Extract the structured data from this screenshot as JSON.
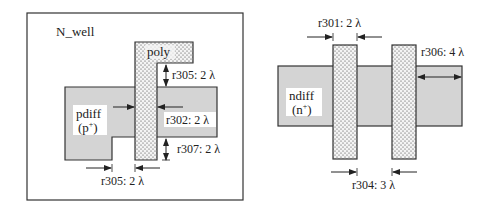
{
  "colors": {
    "background": "#ffffff",
    "diffusion_fill": "#d4d4d4",
    "poly_fill": "#f4f4f4",
    "poly_dots": "#333333",
    "outline": "#333333",
    "label_bg": "#ffffff"
  },
  "left_panel": {
    "well_label": "N_well",
    "poly_label": "poly",
    "diff_label_line1": "pdiff",
    "diff_label_line2": "(p",
    "diff_label_sup": "+",
    "diff_label_close": ")",
    "rules": [
      {
        "id": "r305",
        "text": "r305: 2 λ",
        "position": "poly extension above diffusion"
      },
      {
        "id": "r302",
        "text": "r302: 2 λ",
        "position": "poly width"
      },
      {
        "id": "r307",
        "text": "r307: 2 λ",
        "position": "poly extension below diffusion"
      },
      {
        "id": "r305b",
        "text": "r305: 2 λ",
        "position": "poly to diffusion spacing"
      }
    ]
  },
  "right_panel": {
    "diff_label_line1": "ndiff",
    "diff_label_line2": "(n",
    "diff_label_sup": "+",
    "diff_label_close": ")",
    "rules": [
      {
        "id": "r301",
        "text": "r301: 2 λ",
        "position": "poly width"
      },
      {
        "id": "r306",
        "text": "r306: 4 λ",
        "position": "diffusion extension beyond poly"
      },
      {
        "id": "r304",
        "text": "r304: 3 λ",
        "position": "poly to poly spacing"
      }
    ]
  }
}
